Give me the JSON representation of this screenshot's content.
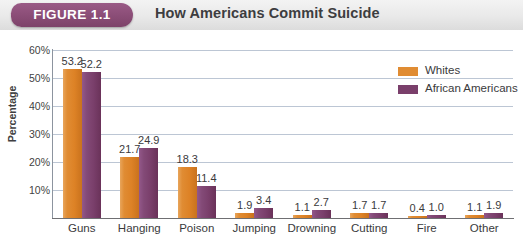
{
  "header": {
    "badge": "FIGURE 1.1",
    "title": "How Americans Commit Suicide",
    "badge_color": "#8d4f79",
    "band_color": "#e9e9e9"
  },
  "legend": {
    "position": "top-right",
    "items": [
      {
        "label": "Whites",
        "color": "#e08c33",
        "icon": "legend-swatch-icon"
      },
      {
        "label": "African Americans",
        "color": "#7a3f6b",
        "icon": "legend-swatch-icon"
      }
    ]
  },
  "chart_data": {
    "type": "bar",
    "title": "How Americans Commit Suicide",
    "xlabel": "",
    "ylabel": "Percentage",
    "ylim": [
      0,
      60
    ],
    "ytick_labels": [
      "10%",
      "20%",
      "30%",
      "40%",
      "50%",
      "60%"
    ],
    "yticks": [
      10,
      20,
      30,
      40,
      50,
      60
    ],
    "grid": true,
    "categories": [
      "Guns",
      "Hanging",
      "Poison",
      "Jumping",
      "Drowning",
      "Cutting",
      "Fire",
      "Other"
    ],
    "series": [
      {
        "name": "Whites",
        "color": "#e08c33",
        "values": [
          53.2,
          21.7,
          18.3,
          1.9,
          1.1,
          1.7,
          0.4,
          1.1
        ]
      },
      {
        "name": "African Americans",
        "color": "#7a3f6b",
        "values": [
          52.2,
          24.9,
          11.4,
          3.4,
          2.7,
          1.7,
          1.0,
          1.9
        ]
      }
    ]
  }
}
